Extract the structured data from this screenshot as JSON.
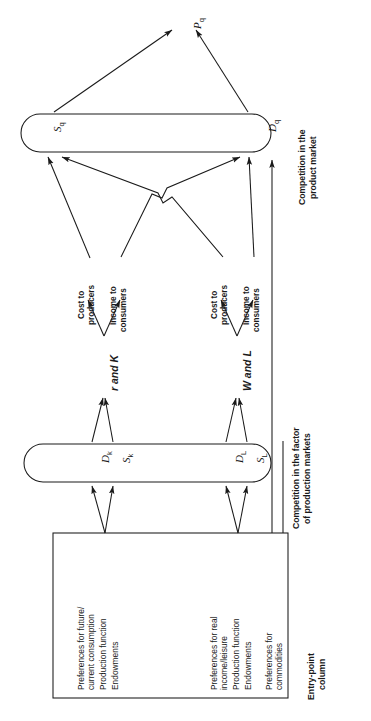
{
  "figure": {
    "orientation": "rotated-90-ccw",
    "type": "economic-flow-diagram",
    "ink_color": "#1a1a1a",
    "background_color": "#ffffff"
  },
  "nodes": {
    "price": {
      "base": "P",
      "sub": "q"
    },
    "product_market": {
      "supply": {
        "base": "S",
        "sub": "q"
      },
      "demand": {
        "base": "D",
        "sub": "q"
      },
      "caption_line1": "Competition in the",
      "caption_line2": "product market"
    },
    "factor_markets": {
      "capital_demand": {
        "base": "D",
        "sub": "k"
      },
      "capital_supply": {
        "base": "S",
        "sub": "k"
      },
      "labour_demand": {
        "base": "D",
        "sub": "L"
      },
      "labour_supply": {
        "base": "S",
        "sub": "L"
      },
      "caption_line1": "Competition in the factor",
      "caption_line2": "of production markets"
    }
  },
  "variables": {
    "capital": "r and K",
    "labour": "W and L"
  },
  "flows": {
    "capital_cost_line1": "Cost to",
    "capital_cost_line2": "producers",
    "capital_income_line1": "Income to",
    "capital_income_line2": "consumers",
    "labour_cost_line1": "Cost to",
    "labour_cost_line2": "producers",
    "labour_income_line1": "Income to",
    "labour_income_line2": "consumers"
  },
  "entry_point_column": {
    "caption_line1": "Entry-point",
    "caption_line2": "column",
    "groups": [
      {
        "name": "capital-entry-points",
        "items": [
          "Preferences for future/\ncurrent consumption",
          "Production function",
          "Endowments"
        ]
      },
      {
        "name": "labour-entry-points",
        "items": [
          "Preferences for real\nincome/leisure",
          "Production function",
          "Endowments"
        ]
      },
      {
        "name": "commodity-entry-points",
        "items": [
          "Preferences for\ncommodities"
        ]
      }
    ]
  }
}
